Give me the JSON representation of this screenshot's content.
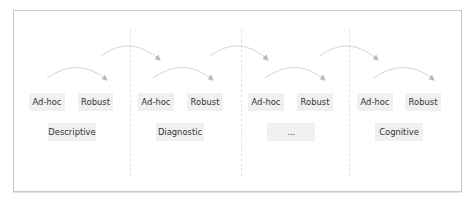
{
  "diagram": {
    "stages": [
      {
        "name": "Descriptive",
        "steps": [
          "Ad-hoc",
          "Robust"
        ]
      },
      {
        "name": "Diagnostic",
        "steps": [
          "Ad-hoc",
          "Robust"
        ]
      },
      {
        "name": "...",
        "steps": [
          "Ad-hoc",
          "Robust"
        ]
      },
      {
        "name": "Cognitive",
        "steps": [
          "Ad-hoc",
          "Robust"
        ]
      }
    ],
    "colors": {
      "box_fill": "#f0f0f0",
      "arrow": "#c4c4c4",
      "frame": "#c8c8c8",
      "separator": "#e2e2e2"
    }
  }
}
